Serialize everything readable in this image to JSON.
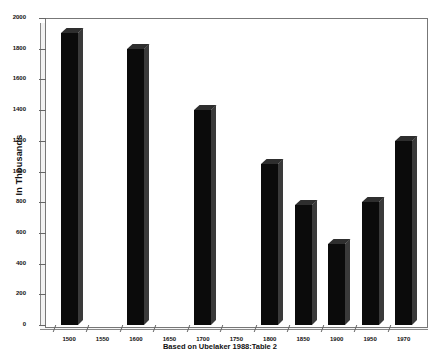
{
  "chart_data": {
    "type": "bar",
    "title": "",
    "subtitle": "",
    "xlabel": "Based on Ubelaker 1988:Table 2",
    "ylabel": "In Thousands",
    "categories": [
      "1500",
      "1550",
      "1600",
      "1650",
      "1700",
      "1750",
      "1800",
      "1850",
      "1900",
      "1950",
      "1970"
    ],
    "values": [
      1900,
      null,
      1800,
      null,
      1400,
      null,
      1050,
      780,
      530,
      800,
      1200
    ],
    "ylim": [
      0,
      2000
    ],
    "yticks": [
      0,
      200,
      400,
      600,
      800,
      1000,
      1200,
      1400,
      1600,
      1800,
      2000
    ],
    "ytick_labels": [
      "0",
      "200",
      "400",
      "600",
      "800",
      "1000",
      "1200",
      "1400",
      "1600",
      "1800",
      "2000"
    ],
    "grid": false,
    "legend": null,
    "bar_color": "#0b0b0b",
    "frame_color": "#777777",
    "style": "3d-bars"
  }
}
